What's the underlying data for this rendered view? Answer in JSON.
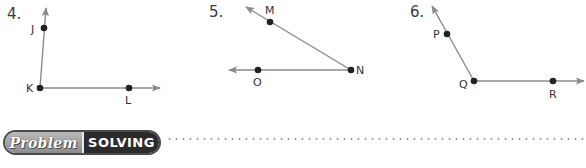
{
  "exercises": [
    {
      "number": "4.",
      "points": {
        "vertex": "K",
        "ray1": "J",
        "ray2": "L"
      }
    },
    {
      "number": "5.",
      "points": {
        "vertex": "N",
        "ray1": "M",
        "ray2": "O"
      }
    },
    {
      "number": "6.",
      "points": {
        "vertex": "Q",
        "ray1": "P",
        "ray2": "R"
      }
    }
  ],
  "banner": {
    "left_label": "Problem",
    "right_label": "SOLVING"
  },
  "colors": {
    "ray": "#8a8a8a",
    "point": "#222222",
    "banner_dark": "#2b2b2b",
    "banner_light": "#a5a5a5"
  }
}
